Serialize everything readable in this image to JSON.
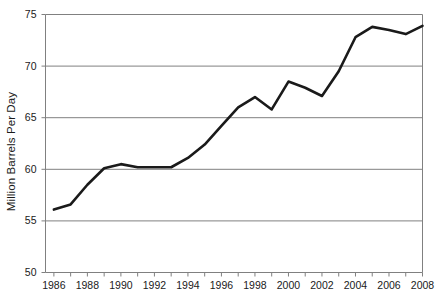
{
  "chart_data": {
    "type": "line",
    "title": "",
    "xlabel": "",
    "ylabel": "Million Barrels Per Day",
    "xlim": [
      1985.5,
      2008.0
    ],
    "ylim": [
      50,
      75
    ],
    "grid": true,
    "legend": null,
    "y_ticks": [
      50,
      55,
      60,
      65,
      70,
      75
    ],
    "y_tick_labels": [
      "50",
      "55",
      "60",
      "65",
      "70",
      "75"
    ],
    "x_ticks": [
      1986,
      1987,
      1988,
      1989,
      1990,
      1991,
      1992,
      1993,
      1994,
      1995,
      1996,
      1997,
      1998,
      1999,
      2000,
      2001,
      2002,
      2003,
      2004,
      2005,
      2006,
      2007,
      2008
    ],
    "x_tick_labels_shown": [
      "1986",
      "1988",
      "1990",
      "1992",
      "1994",
      "1996",
      "1998",
      "2000",
      "2002",
      "2004",
      "2006",
      "2008"
    ],
    "x": [
      1986,
      1987,
      1988,
      1989,
      1990,
      1991,
      1992,
      1993,
      1994,
      1995,
      1996,
      1997,
      1998,
      1999,
      2000,
      2001,
      2002,
      2003,
      2004,
      2005,
      2006,
      2007,
      2008
    ],
    "values": [
      56.1,
      56.6,
      58.5,
      60.1,
      60.5,
      60.2,
      60.2,
      60.2,
      61.1,
      62.4,
      64.2,
      66.0,
      67.0,
      65.8,
      68.5,
      67.9,
      67.1,
      69.5,
      72.8,
      73.8,
      73.5,
      73.1,
      73.9
    ],
    "series_name": "World Oil Production",
    "line_color": "#1a1a1a",
    "line_width": 2.6,
    "grid_color": "#808080",
    "frame_color": "#808080",
    "background": "#ffffff"
  },
  "axis": {
    "y_title": "Million Barrels Per Day"
  }
}
